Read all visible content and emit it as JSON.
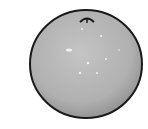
{
  "image": {
    "subject": "orange",
    "style": "grayscale clip-art drawing",
    "colors": {
      "background": "#ffffff",
      "fruit_fill": "#b8b8b8",
      "fruit_shade": "#8f8f8f",
      "outline": "#1a1a1a",
      "highlight": "#f2f2f2"
    }
  }
}
